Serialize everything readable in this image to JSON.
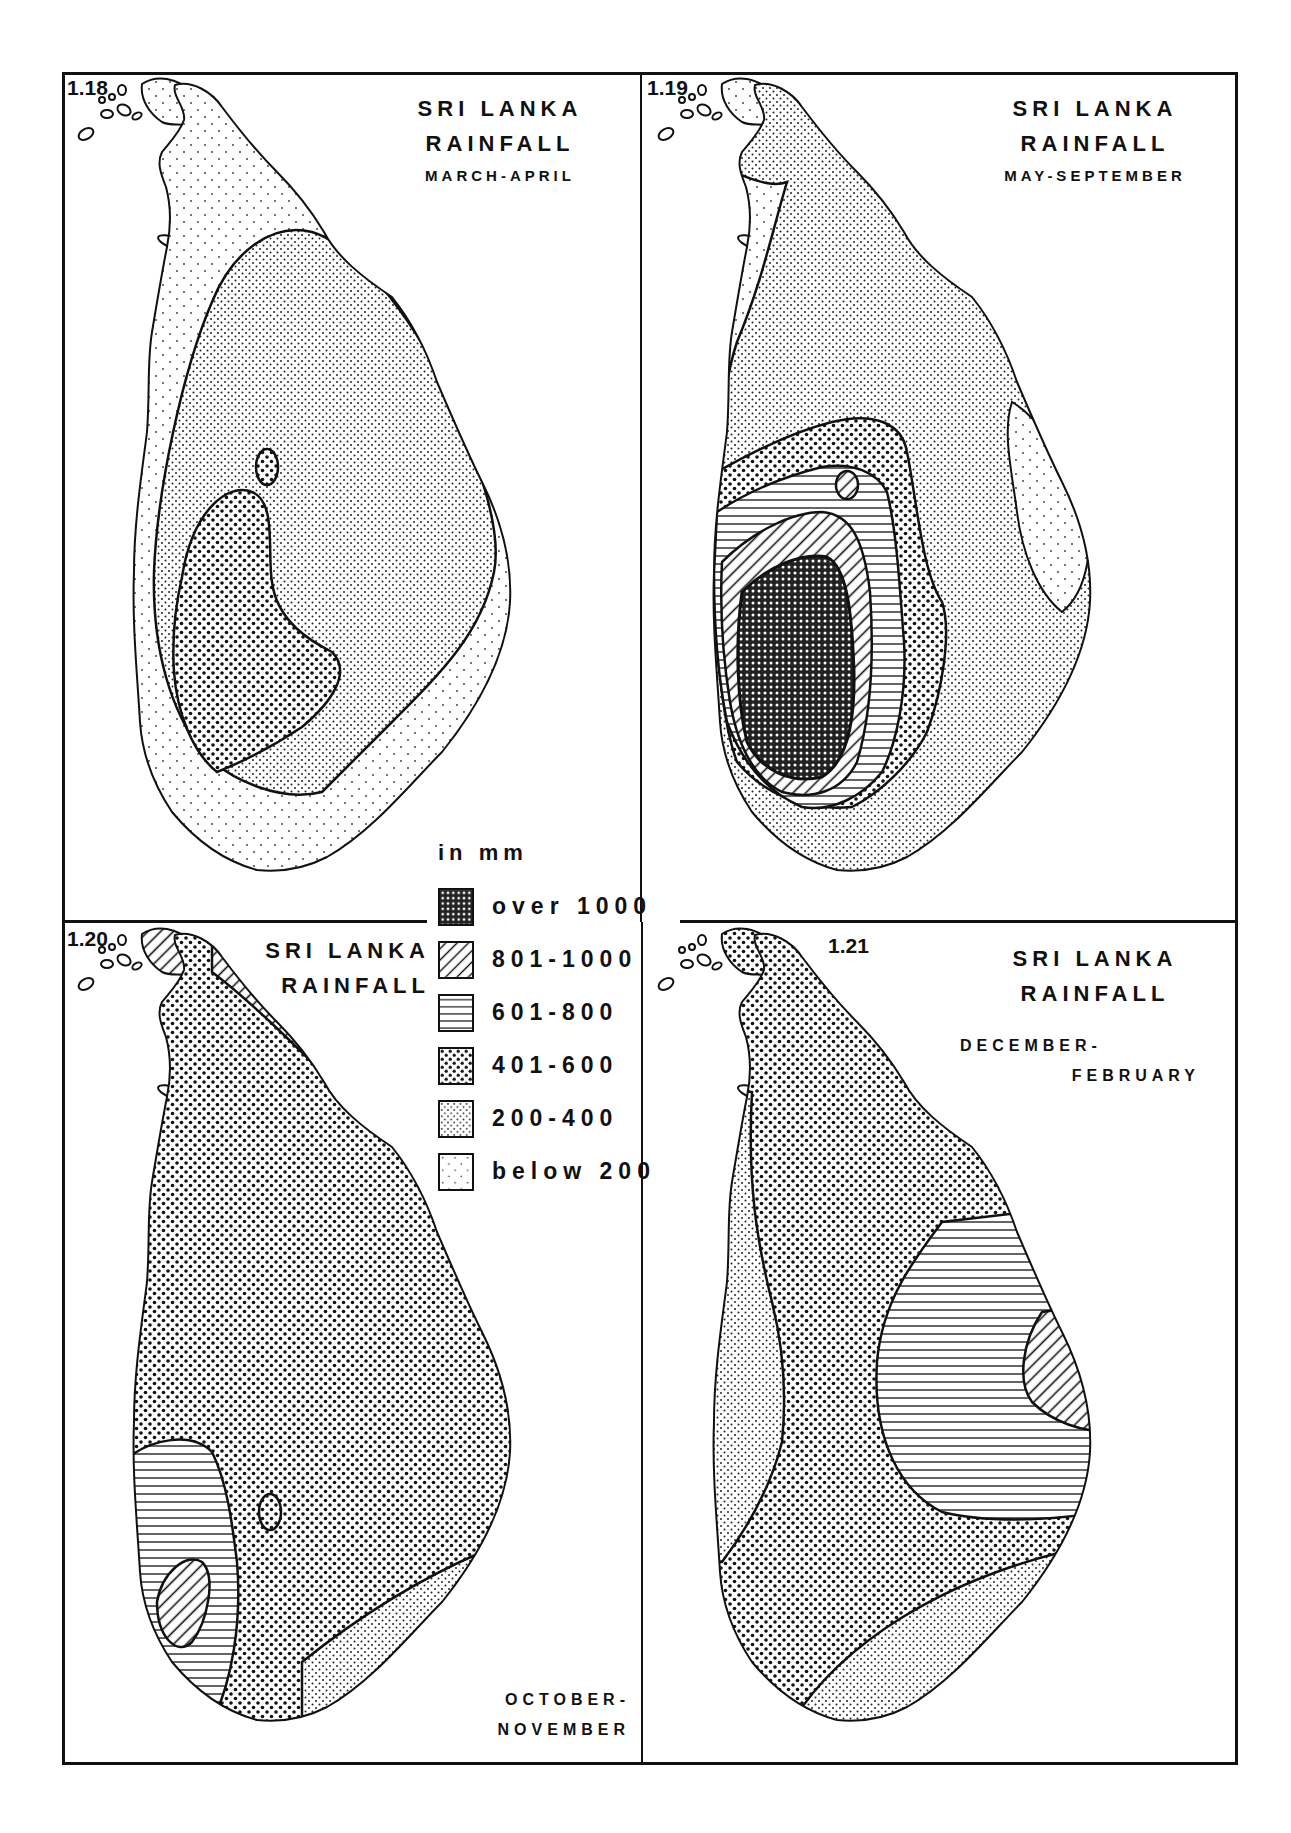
{
  "figure": {
    "panels": [
      {
        "id": "1.18",
        "number": "1.18",
        "title_line1": "SRI LANKA",
        "title_line2": "RAINFALL",
        "season": "MARCH-APRIL"
      },
      {
        "id": "1.19",
        "number": "1.19",
        "title_line1": "SRI LANKA",
        "title_line2": "RAINFALL",
        "season": "MAY-SEPTEMBER"
      },
      {
        "id": "1.20",
        "number": "1.20",
        "title_line1": "SRI LANKA",
        "title_line2": "RAINFALL",
        "season_line1": "OCTOBER-",
        "season_line2": "NOVEMBER"
      },
      {
        "id": "1.21",
        "number": "1.21",
        "title_line1": "SRI LANKA",
        "title_line2": "RAINFALL",
        "season_line1": "DECEMBER-",
        "season_line2": "FEBRUARY"
      }
    ]
  },
  "legend": {
    "unit": "in mm",
    "items": [
      {
        "label": "over 1000",
        "pattern": "crosshatch-dense"
      },
      {
        "label": "801-1000",
        "pattern": "diagonal-hatch"
      },
      {
        "label": "601-800",
        "pattern": "horizontal-lines"
      },
      {
        "label": "401-600",
        "pattern": "coarse-dots"
      },
      {
        "label": "200-400",
        "pattern": "fine-dots"
      },
      {
        "label": "below 200",
        "pattern": "sparse-dots"
      }
    ]
  },
  "colors": {
    "ink": "#111111",
    "paper": "#ffffff"
  }
}
